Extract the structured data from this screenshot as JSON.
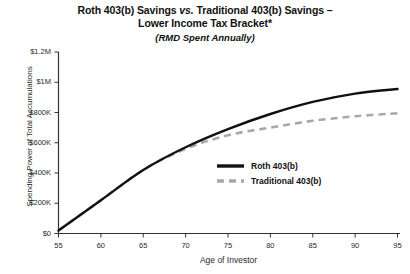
{
  "chart_data": {
    "type": "line",
    "title": "Roth 403(b) Savings vs. Traditional 403(b) Savings –",
    "title_line1_pre": "Roth 403(b) Savings ",
    "title_line1_ital": "vs.",
    "title_line1_post": " Traditional 403(b) Savings –",
    "title_line2": "Lower Income Tax Bracket*",
    "subtitle": "(RMD Spent Annually)",
    "xlabel": "Age of Investor",
    "ylabel": "Spending Power of Total Accumulations",
    "xlim": [
      55,
      95
    ],
    "ylim": [
      0,
      1200000
    ],
    "grid": false,
    "legend_position": "inside-right",
    "xticks": [
      55,
      60,
      65,
      70,
      75,
      80,
      85,
      90,
      95
    ],
    "xtick_labels": [
      "55",
      "60",
      "65",
      "70",
      "75",
      "80",
      "85",
      "90",
      "95"
    ],
    "yticks": [
      0,
      200000,
      400000,
      600000,
      800000,
      1000000,
      1200000
    ],
    "ytick_labels": [
      "$0",
      "$200K",
      "$400K",
      "$600K",
      "$800K",
      "$1M",
      "$1.2M"
    ],
    "x": [
      55,
      60,
      65,
      70,
      75,
      80,
      85,
      90,
      95
    ],
    "series": [
      {
        "name": "Roth 403(b)",
        "style": "solid",
        "color": "#111111",
        "values": [
          20000,
          220000,
          420000,
          570000,
          690000,
          790000,
          870000,
          925000,
          955000
        ]
      },
      {
        "name": "Traditional 403(b)",
        "style": "dashed",
        "color": "#a8a8a8",
        "values": [
          20000,
          220000,
          420000,
          560000,
          650000,
          700000,
          745000,
          775000,
          795000
        ]
      }
    ]
  },
  "legend": {
    "items": [
      {
        "label": "Roth 403(b)"
      },
      {
        "label": "Traditional 403(b)"
      }
    ]
  },
  "colors": {
    "roth_line": "#111111",
    "traditional_line": "#a8a8a8",
    "axis": "#333333",
    "background": "#ffffff"
  }
}
